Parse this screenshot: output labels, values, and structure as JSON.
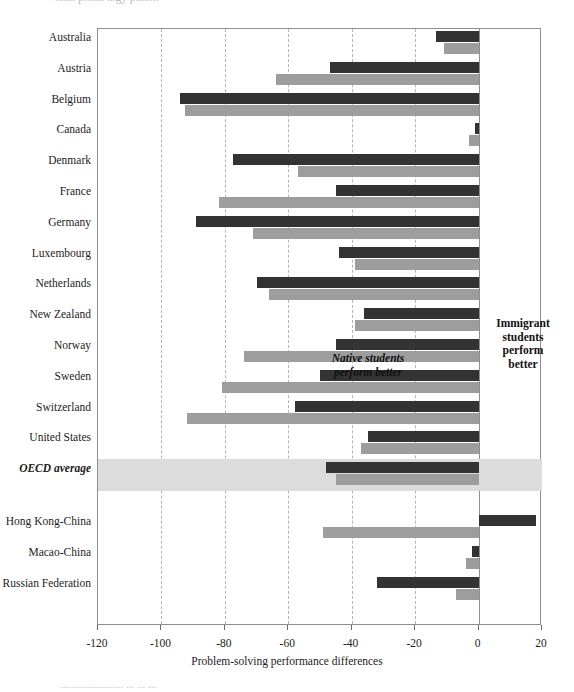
{
  "figure": {
    "top_clipped_text": "....... p....... ...gy p........",
    "bottom_clipped_text": "....................... ... ... ...",
    "xaxis_title": "Problem-solving performance differences",
    "annotations": {
      "left": "Native students\nperform better",
      "left_line1": "Native students",
      "left_line2": "perform better",
      "right_line1": "Immigrant",
      "right_line2": "students",
      "right_line3": "perform",
      "right_line4": "better"
    },
    "colors": {
      "series1": "#333333",
      "series2": "#9d9d9d",
      "highlight_band": "#dcdcdc",
      "gridline": "#b4b4b4",
      "frame": "#8e8e8e"
    }
  },
  "chart_data": {
    "type": "bar",
    "orientation": "horizontal",
    "title": "",
    "xlabel": "Problem-solving performance differences",
    "ylabel": "",
    "xlim": [
      -120,
      20
    ],
    "xticks": [
      -120,
      -100,
      -80,
      -60,
      -40,
      -20,
      0,
      20
    ],
    "xtick_labels": [
      "-120",
      "-100",
      "-80",
      "-60",
      "-40",
      "-20",
      "0",
      "20"
    ],
    "grid": true,
    "grid_axis": "x",
    "legend": "none",
    "zero_reference": 0,
    "categories": [
      "Australia",
      "Austria",
      "Belgium",
      "Canada",
      "Denmark",
      "France",
      "Germany",
      "Luxembourg",
      "Netherlands",
      "New Zealand",
      "Norway",
      "Sweden",
      "Switzerland",
      "United States",
      "OECD average",
      "Hong Kong-China",
      "Macao-China",
      "Russian Federation"
    ],
    "highlighted_category": "OECD average",
    "group_break_after": "OECD average",
    "series": [
      {
        "name": "series1",
        "color": "#333333",
        "values": [
          -13.5,
          -47,
          -94,
          -1,
          -77.5,
          -45,
          -89,
          -44,
          -70,
          -36,
          -45,
          -50,
          -58,
          -35,
          -48,
          18,
          -2,
          -32
        ]
      },
      {
        "name": "series2",
        "color": "#9d9d9d",
        "values": [
          -11,
          -64,
          -92.5,
          -3,
          -57,
          -82,
          -71,
          -39,
          -66,
          -39,
          -74,
          -81,
          -92,
          -37,
          -45,
          -49,
          -4,
          -7
        ]
      }
    ]
  }
}
